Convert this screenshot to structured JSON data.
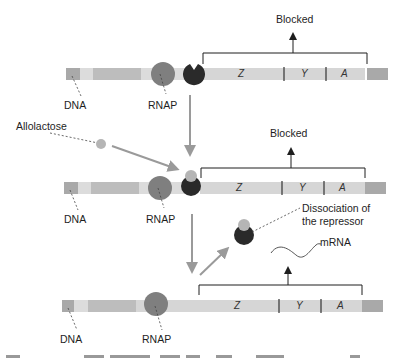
{
  "diagram": {
    "type": "lac operon induction by allolactose",
    "colors": {
      "dna_light": "#dcdcdc",
      "dna_mid": "#c8c8c8",
      "dna_dark": "#a9a9a9",
      "operon_bar": "#d6d6d6",
      "rnap": "#7f7f7f",
      "repressor": "#2a2a2a",
      "allolactose": "#b5b5b5",
      "process_arrow": "#9a9a9a",
      "bracket": "#1e1e1e"
    },
    "panels": [
      {
        "id": "panel-1",
        "status_label": "Blocked",
        "dna_label": "DNA",
        "rnap_label": "RNAP",
        "genes": [
          "Z",
          "Y",
          "A"
        ],
        "repressor_state": "bound"
      },
      {
        "id": "panel-2",
        "status_label": "Blocked",
        "dna_label": "DNA",
        "rnap_label": "RNAP",
        "genes": [
          "Z",
          "Y",
          "A"
        ],
        "repressor_state": "bound with allolactose",
        "inducer_label": "Allolactose"
      },
      {
        "id": "panel-3",
        "dissociation_label_line1": "Dissociation of",
        "dissociation_label_line2": "the repressor",
        "mrna_label": "mRNA",
        "dna_label": "DNA",
        "rnap_label": "RNAP",
        "genes": [
          "Z",
          "Y",
          "A"
        ],
        "repressor_state": "dissociated"
      }
    ]
  }
}
